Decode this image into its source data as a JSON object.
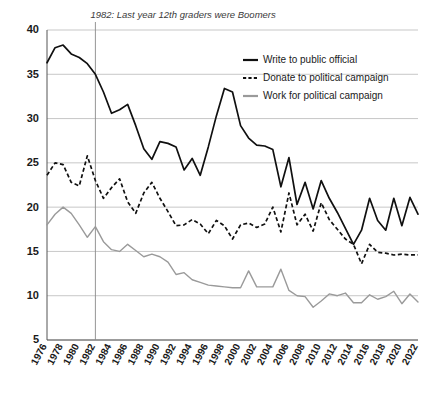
{
  "chart_data": {
    "type": "line",
    "title": "",
    "xlabel": "",
    "ylabel": "",
    "ylim": [
      5,
      40
    ],
    "xlim": [
      1976,
      2022
    ],
    "grid": true,
    "legend_position": "top-right",
    "ytick_labels": [
      "40",
      "35",
      "30",
      "25",
      "20",
      "15",
      "10",
      "5"
    ],
    "ytick_values": [
      40,
      35,
      30,
      25,
      20,
      15,
      10,
      5
    ],
    "xtick_labels": [
      "1976",
      "1978",
      "1980",
      "1982",
      "1984",
      "1986",
      "1988",
      "1990",
      "1992",
      "1994",
      "1996",
      "1998",
      "2000",
      "2002",
      "2004",
      "2006",
      "2008",
      "2010",
      "2012",
      "2014",
      "2016",
      "2018",
      "2020",
      "2022"
    ],
    "xtick_values": [
      1976,
      1978,
      1980,
      1982,
      1984,
      1986,
      1988,
      1990,
      1992,
      1994,
      1996,
      1998,
      2000,
      2002,
      2004,
      2006,
      2008,
      2010,
      2012,
      2014,
      2016,
      2018,
      2020,
      2022
    ],
    "x": [
      1976,
      1977,
      1978,
      1979,
      1980,
      1981,
      1982,
      1983,
      1984,
      1985,
      1986,
      1987,
      1988,
      1989,
      1990,
      1991,
      1992,
      1993,
      1994,
      1995,
      1996,
      1997,
      1998,
      1999,
      2000,
      2001,
      2002,
      2003,
      2004,
      2005,
      2006,
      2007,
      2008,
      2009,
      2010,
      2011,
      2012,
      2013,
      2014,
      2015,
      2016,
      2017,
      2018,
      2019,
      2020,
      2021,
      2022
    ],
    "annotations": [
      {
        "text": "1982: Last year 12th graders were Boomers",
        "x_value": 1982,
        "has_vertical_rule": true
      }
    ],
    "series": [
      {
        "name": "Write to public official",
        "style": "solid",
        "color": "#101010",
        "values": [
          36.3,
          38.0,
          38.3,
          37.3,
          36.9,
          36.2,
          35.0,
          33.0,
          30.6,
          31.0,
          31.6,
          29.2,
          26.6,
          25.4,
          27.4,
          27.2,
          26.8,
          24.2,
          25.5,
          23.6,
          26.8,
          30.3,
          33.4,
          33.0,
          29.2,
          27.8,
          27.0,
          26.9,
          26.5,
          22.3,
          25.6,
          20.3,
          22.8,
          19.8,
          23.0,
          21.0,
          19.4,
          17.6,
          15.8,
          17.4,
          21.0,
          18.5,
          17.4,
          21.0,
          17.9,
          21.1,
          19.2
        ]
      },
      {
        "name": "Donate to political campaign",
        "style": "dashed",
        "color": "#101010",
        "values": [
          23.6,
          25.0,
          24.8,
          22.8,
          22.4,
          25.8,
          23.0,
          21.0,
          22.2,
          23.2,
          20.6,
          19.3,
          21.6,
          22.8,
          21.0,
          19.5,
          17.9,
          18.0,
          18.6,
          18.1,
          17.0,
          18.5,
          17.9,
          16.4,
          18.0,
          18.2,
          17.7,
          18.1,
          20.0,
          17.2,
          21.6,
          18.0,
          19.2,
          17.3,
          20.5,
          18.6,
          17.5,
          16.4,
          15.8,
          13.6,
          15.8,
          14.9,
          14.8,
          14.6,
          14.7,
          14.6,
          14.6
        ]
      },
      {
        "name": "Work for political campaign",
        "style": "solid-gray",
        "color": "#9a9a9a",
        "values": [
          18.0,
          19.2,
          20.0,
          19.3,
          18.0,
          16.6,
          17.8,
          16.1,
          15.2,
          15.0,
          15.8,
          15.1,
          14.4,
          14.7,
          14.4,
          13.8,
          12.4,
          12.6,
          11.8,
          11.5,
          11.2,
          11.1,
          11.0,
          10.9,
          10.9,
          12.8,
          11.0,
          11.0,
          11.0,
          13.0,
          10.6,
          10.0,
          9.9,
          8.7,
          9.4,
          10.2,
          10.0,
          10.3,
          9.2,
          9.2,
          10.1,
          9.6,
          9.9,
          10.5,
          9.1,
          10.2,
          9.3
        ]
      }
    ]
  },
  "legend": {
    "items": [
      {
        "label": "Write to public official"
      },
      {
        "label": "Donate to political campaign"
      },
      {
        "label": "Work for political campaign"
      }
    ]
  }
}
